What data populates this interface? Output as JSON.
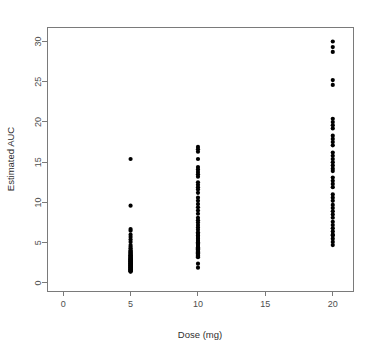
{
  "chart_data": {
    "type": "scatter",
    "title": "",
    "xlabel": "Dose (mg)",
    "ylabel": "Estimated AUC",
    "xlim": [
      -1.2,
      21.5
    ],
    "ylim": [
      -1.0,
      31.8
    ],
    "xticks": [
      0,
      5,
      10,
      15,
      20
    ],
    "xticklabels": [
      "0",
      "5",
      "10",
      "15",
      "20"
    ],
    "yticks": [
      0,
      5,
      10,
      15,
      20,
      25,
      30
    ],
    "yticklabels": [
      "0",
      "5",
      "10",
      "15",
      "20",
      "25",
      "30"
    ],
    "grid": false,
    "legend": null,
    "marker": "filled-circle",
    "marker_size": 2.1,
    "point_color": "#000000",
    "frame_color": "#7a7a7a",
    "series": [
      {
        "name": "Dose 5 mg",
        "x": 5,
        "values": [
          15.4,
          9.6,
          6.7,
          6.5,
          6.0,
          5.7,
          5.4,
          5.1,
          4.7,
          4.5,
          4.3,
          4.1,
          4.0,
          3.9,
          3.8,
          3.7,
          3.6,
          3.5,
          3.45,
          3.4,
          3.3,
          3.25,
          3.2,
          3.1,
          3.05,
          3.0,
          2.95,
          2.9,
          2.85,
          2.8,
          2.75,
          2.7,
          2.65,
          2.6,
          2.55,
          2.5,
          2.45,
          2.4,
          2.35,
          2.3,
          2.25,
          2.2,
          2.15,
          2.1,
          2.05,
          2.0,
          1.95,
          1.9,
          1.85,
          1.8,
          1.75,
          1.7,
          1.65,
          1.6,
          1.55,
          1.5,
          1.45,
          1.4
        ]
      },
      {
        "name": "Dose 10 mg",
        "x": 10,
        "values": [
          16.9,
          16.6,
          16.3,
          15.4,
          14.4,
          14.1,
          13.8,
          13.5,
          13.2,
          12.5,
          12.2,
          11.9,
          11.6,
          11.2,
          10.6,
          10.2,
          9.8,
          9.4,
          9.0,
          8.6,
          8.1,
          7.8,
          7.5,
          7.2,
          6.9,
          6.6,
          6.3,
          6.1,
          5.9,
          5.7,
          5.5,
          5.35,
          5.2,
          5.05,
          4.9,
          4.75,
          4.6,
          4.45,
          4.3,
          4.2,
          4.1,
          4.0,
          3.9,
          3.8,
          3.7,
          3.6,
          3.5,
          3.4,
          3.3,
          3.2,
          2.4,
          1.9
        ]
      },
      {
        "name": "Dose 20 mg",
        "x": 20,
        "values": [
          30.0,
          29.3,
          28.7,
          25.2,
          24.6,
          20.4,
          20.0,
          19.6,
          19.2,
          18.3,
          17.9,
          17.5,
          17.1,
          16.2,
          15.8,
          15.4,
          15.0,
          14.6,
          14.2,
          13.9,
          13.1,
          12.7,
          12.3,
          11.9,
          11.0,
          10.6,
          10.2,
          9.7,
          9.3,
          8.9,
          8.5,
          8.1,
          7.6,
          7.2,
          6.8,
          6.4,
          6.0,
          5.9,
          5.5,
          5.1,
          4.7
        ]
      }
    ]
  }
}
